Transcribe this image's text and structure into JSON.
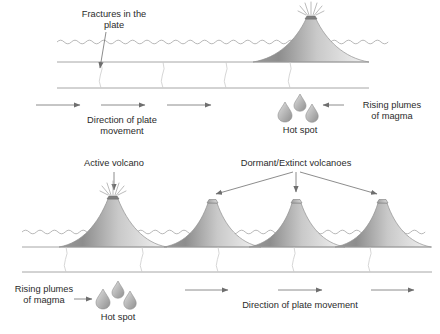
{
  "figure": {
    "background_color": "#ffffff",
    "text_color": "#2b2b2b",
    "line_color": "#8d8d8d",
    "arrow_color": "#6e6e6e",
    "cone_dark": "#8a8a8a",
    "cone_light": "#ededed",
    "plume_dark": "#9a9a9a",
    "plume_light": "#e4e4e4"
  },
  "panels": [
    {
      "id": "top-panel",
      "name": "early-stage",
      "sea_level_y": 42,
      "plate_top_y": 62,
      "plate_bottom_y": 88,
      "labels": {
        "fractures": "Fractures in the\nplate",
        "fractures_line1": "Fractures in the",
        "fractures_line2": "plate",
        "plate_movement_line1": "Direction of plate",
        "plate_movement_line2": "movement",
        "hot_spot": "Hot spot",
        "rising_plumes_line1": "Rising plumes",
        "rising_plumes_line2": "of magma"
      },
      "volcanoes": [
        {
          "name": "active-volcano-top",
          "state": "active",
          "cx": 311,
          "base_half_width": 58,
          "summit_y": 16,
          "erupting": true
        }
      ],
      "fractures_x": [
        101,
        163,
        226,
        290
      ],
      "movement_arrows": [
        {
          "x1": 36,
          "x2": 80,
          "y": 105
        },
        {
          "x1": 101,
          "x2": 145,
          "y": 105
        },
        {
          "x1": 167,
          "x2": 211,
          "y": 105
        }
      ],
      "plumes": [
        {
          "cx": 285,
          "cy": 113,
          "size": 11
        },
        {
          "cx": 300,
          "cy": 104,
          "size": 9
        },
        {
          "cx": 312,
          "cy": 114,
          "size": 10
        }
      ]
    },
    {
      "id": "bottom-panel",
      "name": "later-stage",
      "sea_level_y": 232,
      "plate_top_y": 247,
      "plate_bottom_y": 272,
      "labels": {
        "active_volcano": "Active volcano",
        "dormant_extinct": "Dormant/Extinct volcanoes",
        "plate_movement": "Direction of plate movement",
        "hot_spot": "Hot spot",
        "rising_plumes_line1": "Rising plumes",
        "rising_plumes_line2": "of magma"
      },
      "volcanoes": [
        {
          "name": "active-volcano-bottom",
          "state": "active",
          "cx": 113,
          "base_half_width": 54,
          "summit_y": 196,
          "erupting": true
        },
        {
          "name": "dormant-volcano-1",
          "state": "dormant",
          "cx": 212,
          "base_half_width": 48,
          "summit_y": 199,
          "erupting": false
        },
        {
          "name": "dormant-volcano-2",
          "state": "dormant",
          "cx": 296,
          "base_half_width": 48,
          "summit_y": 199,
          "erupting": false
        },
        {
          "name": "dormant-volcano-3",
          "state": "dormant",
          "cx": 382,
          "base_half_width": 48,
          "summit_y": 199,
          "erupting": false
        }
      ],
      "fractures_x": [
        66,
        142,
        218,
        294,
        370
      ],
      "movement_arrows": [
        {
          "x1": 185,
          "x2": 228,
          "y": 290
        },
        {
          "x1": 278,
          "x2": 322,
          "y": 290
        },
        {
          "x1": 371,
          "x2": 414,
          "y": 290
        }
      ],
      "plumes": [
        {
          "cx": 103,
          "cy": 300,
          "size": 11
        },
        {
          "cx": 118,
          "cy": 291,
          "size": 9
        },
        {
          "cx": 130,
          "cy": 301,
          "size": 10
        }
      ]
    }
  ]
}
